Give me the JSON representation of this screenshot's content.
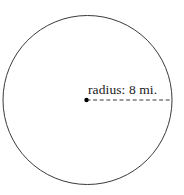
{
  "figure": {
    "type": "circle-radius-diagram",
    "background_color": "#ffffff",
    "width": 184,
    "height": 195,
    "shape": {
      "name": "circle",
      "center_x": 87.5,
      "center_y": 100,
      "radius_px": 84.5,
      "stroke_color": "#3a3a3a",
      "stroke_width": 1,
      "fill": "none"
    },
    "center_point": {
      "name": "center-dot",
      "x": 86.5,
      "y": 100,
      "diameter_px": 4.4,
      "color": "#000000"
    },
    "radius_segment": {
      "name": "radius-line",
      "from_x": 86.5,
      "from_y": 100,
      "to_x": 171.5,
      "to_y": 100,
      "style": "dashed",
      "dash_pattern": "4 2.6",
      "stroke_color": "#3a3a3a",
      "stroke_width": 1
    },
    "label": {
      "text": "radius: 8 mi.",
      "measure_name": "radius",
      "value": 8,
      "unit": "mi.",
      "color": "#1a1a1a",
      "font_size_px": 13.5,
      "x": 88,
      "y": 82
    }
  }
}
